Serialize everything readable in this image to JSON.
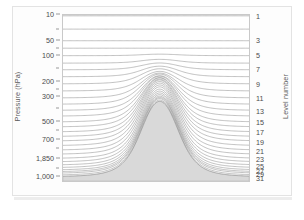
{
  "chart_data": {
    "type": "line",
    "title": "",
    "subtitle": "",
    "ylabel": "Pressure (hPa)",
    "ylabel_right": "Level number",
    "xlabel": "",
    "grid": false,
    "legend": "none",
    "y_axis": {
      "scale": "log-pressure (top to bottom)",
      "ylim": [
        10,
        1000
      ],
      "tick_labels": [
        "10",
        "50",
        "100",
        "200",
        "300",
        "500",
        "700",
        "1,850",
        "1,000"
      ],
      "tick_pressures": [
        10,
        50,
        100,
        200,
        300,
        500,
        700,
        850,
        1000
      ],
      "tick_y_fracs": [
        0.0,
        0.155,
        0.245,
        0.4,
        0.49,
        0.635,
        0.745,
        0.86,
        0.965
      ],
      "minor_tick_y_fracs": [
        0.09,
        0.205,
        0.32,
        0.445,
        0.56,
        0.69,
        0.8,
        0.915
      ]
    },
    "right_axis": {
      "name": "Level number",
      "tick_labels": [
        "1",
        "3",
        "5",
        "7",
        "9",
        "11",
        "13",
        "15",
        "17",
        "19",
        "21",
        "23",
        "25",
        "27",
        "29",
        "31"
      ],
      "tick_values": [
        1,
        3,
        5,
        7,
        9,
        11,
        13,
        15,
        17,
        19,
        21,
        23,
        25,
        27,
        29,
        31
      ],
      "tick_y_fracs": [
        0.01,
        0.155,
        0.245,
        0.33,
        0.415,
        0.5,
        0.575,
        0.645,
        0.705,
        0.76,
        0.815,
        0.865,
        0.905,
        0.935,
        0.955,
        0.975
      ]
    },
    "levels": {
      "count": 31,
      "level_numbers": [
        1,
        2,
        3,
        4,
        5,
        6,
        7,
        8,
        9,
        10,
        11,
        12,
        13,
        14,
        15,
        16,
        17,
        18,
        19,
        20,
        21,
        22,
        23,
        24,
        25,
        26,
        27,
        28,
        29,
        30,
        31
      ],
      "flat_y_fracs": [
        0.005,
        0.085,
        0.155,
        0.2,
        0.245,
        0.29,
        0.33,
        0.372,
        0.415,
        0.458,
        0.5,
        0.538,
        0.575,
        0.61,
        0.645,
        0.675,
        0.705,
        0.733,
        0.76,
        0.788,
        0.815,
        0.84,
        0.865,
        0.886,
        0.905,
        0.921,
        0.935,
        0.946,
        0.955,
        0.966,
        0.975
      ],
      "sigma_weights": [
        0.0,
        0.0,
        0.0,
        0.0,
        0.02,
        0.05,
        0.09,
        0.14,
        0.2,
        0.26,
        0.33,
        0.4,
        0.46,
        0.53,
        0.59,
        0.65,
        0.7,
        0.75,
        0.79,
        0.83,
        0.865,
        0.895,
        0.92,
        0.94,
        0.957,
        0.97,
        0.98,
        0.988,
        0.993,
        0.997,
        1.0
      ]
    },
    "terrain": {
      "shape": "bell",
      "peak_x_frac": 0.52,
      "peak_height_frac": 0.455,
      "half_width_frac": 0.135,
      "base_y_frac": 0.975,
      "fill_color": "#d9d9d9",
      "edge_color": "#bdbdbd"
    },
    "colors": {
      "line": "#8f8f8f",
      "plot_border": "#c9c9c9",
      "background": "#ffffff",
      "card_border": "#e3e3e3",
      "terrain_fill": "#d9d9d9",
      "top_band_fill": "#f2f2f2",
      "bottom_band_fill": "#d9d9d9",
      "text": "#4a4a4a"
    }
  }
}
